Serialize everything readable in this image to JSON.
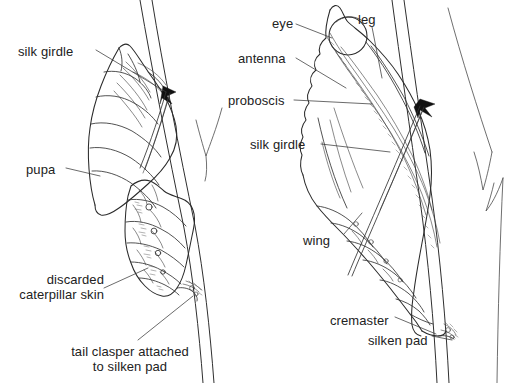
{
  "figure": {
    "background_color": "#ffffff",
    "ink_color": "#222222",
    "panels": [
      {
        "id": "left-panel",
        "name": "pupa-emerging-from-caterpillar-skin",
        "description": "Newly formed pupa hanging from a stem with the discarded caterpillar skin crumpled below it"
      },
      {
        "id": "right-panel",
        "name": "formed-chrysalis",
        "description": "Completed chrysalis attached to a stem by a silk girdle and cremaster"
      }
    ]
  },
  "labels": {
    "left": [
      {
        "key": "silk_girdle",
        "text": "silk girdle",
        "align": "left",
        "x": 18,
        "y": 44
      },
      {
        "key": "pupa",
        "text": "pupa",
        "align": "left",
        "x": 26,
        "y": 162
      },
      {
        "key": "discarded_skin_l1",
        "text": "discarded",
        "align": "right",
        "x": 0,
        "y": 272
      },
      {
        "key": "discarded_skin_l2",
        "text": "caterpillar skin",
        "align": "right",
        "x": 0,
        "y": 287
      },
      {
        "key": "tail_clasper_l1",
        "text": "tail clasper attached",
        "align": "center",
        "x": 55,
        "y": 344
      },
      {
        "key": "tail_clasper_l2",
        "text": "to silken pad",
        "align": "center",
        "x": 55,
        "y": 359
      }
    ],
    "right": [
      {
        "key": "eye",
        "text": "eye",
        "align": "left",
        "x": 272,
        "y": 16
      },
      {
        "key": "leg",
        "text": "leg",
        "align": "left",
        "x": 358,
        "y": 12
      },
      {
        "key": "antenna",
        "text": "antenna",
        "align": "left",
        "x": 238,
        "y": 51
      },
      {
        "key": "proboscis",
        "text": "proboscis",
        "align": "left",
        "x": 228,
        "y": 93
      },
      {
        "key": "silk_girdle",
        "text": "silk girdle",
        "align": "left",
        "x": 250,
        "y": 137
      },
      {
        "key": "wing",
        "text": "wing",
        "align": "left",
        "x": 303,
        "y": 233
      },
      {
        "key": "cremaster",
        "text": "cremaster",
        "align": "left",
        "x": 330,
        "y": 313
      },
      {
        "key": "silken_pad",
        "text": "silken pad",
        "align": "left",
        "x": 368,
        "y": 333
      }
    ]
  },
  "caption": {
    "text": "",
    "note": "caption clipped off bottom edge of image"
  },
  "anatomy_terms": [
    "silk girdle",
    "pupa",
    "discarded caterpillar skin",
    "tail clasper attached to silken pad",
    "eye",
    "leg",
    "antenna",
    "proboscis",
    "wing",
    "cremaster",
    "silken pad"
  ]
}
